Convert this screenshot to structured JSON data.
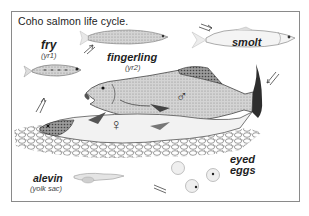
{
  "figure": {
    "title": "Coho salmon life cycle.",
    "stages": [
      {
        "name": "fry",
        "note": "(yr1)"
      },
      {
        "name": "fingerling",
        "note": "(yr2)"
      },
      {
        "name": "smolt",
        "note": ""
      },
      {
        "name": "adult male",
        "symbol": "♂"
      },
      {
        "name": "adult female",
        "symbol": "♀"
      },
      {
        "name": "eyed eggs",
        "note": ""
      },
      {
        "name": "alevin",
        "note": "(yolk sac)"
      }
    ],
    "labels": {
      "fry": "fry",
      "fry_note": "(yr1)",
      "fingerling": "fingerling",
      "fingerling_note": "(yr2)",
      "smolt": "smolt",
      "eyed": "eyed",
      "eggs": "eggs",
      "alevin": "alevin",
      "alevin_note": "(yolk sac)",
      "male_symbol": "♂",
      "female_symbol": "♀"
    },
    "colors": {
      "frame": "#8a8a8a",
      "ink": "#1e1e1e",
      "fish_light": "#e6e6e6",
      "fish_mid": "#b8b8b8",
      "fish_dark": "#5a5a5a"
    }
  }
}
